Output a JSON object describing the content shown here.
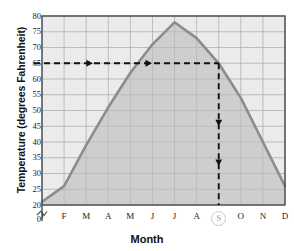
{
  "chart_data": {
    "type": "line",
    "title": "",
    "xlabel": "Month",
    "ylabel": "Temperature (degrees Fahrenheit)",
    "categories": [
      "J",
      "F",
      "M",
      "A",
      "M",
      "J",
      "J",
      "A",
      "S",
      "O",
      "N",
      "D"
    ],
    "month_names": [
      "January",
      "February",
      "March",
      "April",
      "May",
      "June",
      "July",
      "August",
      "September",
      "October",
      "November",
      "December"
    ],
    "values": [
      21,
      26,
      39,
      51,
      62,
      71,
      78,
      73,
      65,
      54,
      40,
      26
    ],
    "ylim": [
      20,
      80
    ],
    "yticks": [
      0,
      20,
      25,
      30,
      35,
      40,
      45,
      50,
      55,
      60,
      65,
      70,
      75,
      80
    ],
    "axis_break": true,
    "axis_break_note": "y-axis broken between 0 and 20",
    "grid": true,
    "legend": "none",
    "area_fill": true,
    "annotations": {
      "horizontal_guide_value": 65,
      "horizontal_guide_label": "65",
      "vertical_guide_category": "S",
      "vertical_guide_month": "September",
      "highlighted_tick": "S",
      "arrow_direction_horizontal": "right",
      "arrow_direction_vertical": "down"
    }
  },
  "colors": {
    "line": "#8c8c8c",
    "area": "#bdbdbd",
    "plot_background": "#ebebeb",
    "grid": "#a8a8a8",
    "axis": "#4a4a4a",
    "guide": "#111111",
    "highlight_ring": "#c9c9c9",
    "text": "#111111"
  }
}
